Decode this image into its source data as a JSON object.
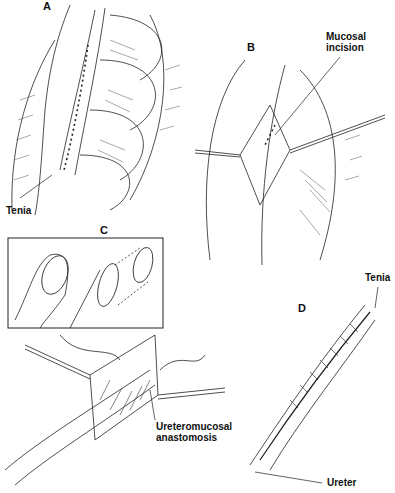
{
  "figure": {
    "panels": [
      {
        "id": "A",
        "letter": "A",
        "labels": [
          {
            "text": "Tenia"
          }
        ]
      },
      {
        "id": "B",
        "letter": "B",
        "labels": [
          {
            "text": "Mucosal\nincision",
            "line1": "Mucosal",
            "line2": "incision"
          }
        ]
      },
      {
        "id": "C",
        "letter": "C",
        "labels": []
      },
      {
        "id": "E",
        "letter": "",
        "labels": [
          {
            "line1": "Ureteromucosal",
            "line2": "anastomosis"
          }
        ]
      },
      {
        "id": "D",
        "letter": "D",
        "labels": [
          {
            "text": "Tenia"
          },
          {
            "text": "Ureter"
          }
        ]
      }
    ]
  },
  "colors": {
    "ink": "#111111",
    "background": "#ffffff"
  }
}
